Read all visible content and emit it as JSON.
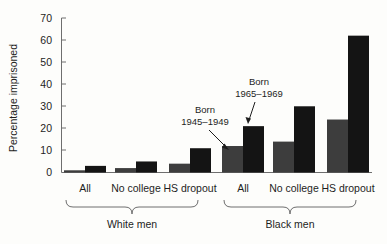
{
  "chart_data": {
    "type": "bar",
    "title": "",
    "subtitle": "",
    "xlabel": "",
    "ylabel": "Percentage imprisoned",
    "ylim": [
      0,
      70
    ],
    "yticks": [
      0,
      10,
      20,
      30,
      40,
      50,
      60,
      70
    ],
    "ytick_labels": [
      "0",
      "10",
      "20",
      "30",
      "40",
      "50",
      "60",
      "70"
    ],
    "grid": false,
    "legend_position": "none",
    "categories": [
      "All",
      "No college",
      "HS dropout",
      "All",
      "No college",
      "HS dropout"
    ],
    "group_labels": [
      "White men",
      "Black men"
    ],
    "series": [
      {
        "name": "Born 1945–1949",
        "color": "#3d3d3d",
        "values": [
          1,
          2,
          4,
          12,
          14,
          24
        ]
      },
      {
        "name": "Born 1965–1969",
        "color": "#141414",
        "values": [
          3,
          5,
          11,
          21,
          30,
          62
        ]
      }
    ],
    "annotations": [
      {
        "id": "annot-1945",
        "line1": "Born",
        "line2": "1945–1949",
        "target_series": "Born 1945–1949",
        "target_category": "All (Black men)"
      },
      {
        "id": "annot-1965",
        "line1": "Born",
        "line2": "1965–1969",
        "target_series": "Born 1965–1969",
        "target_category": "All (Black men)"
      }
    ]
  },
  "axis": {
    "y_title": "Percentage imprisoned",
    "ticks": [
      "70",
      "60",
      "50",
      "40",
      "30",
      "20",
      "10",
      "0"
    ]
  },
  "categories": {
    "white": [
      "All",
      "No college",
      "HS dropout"
    ],
    "black": [
      "All",
      "No college",
      "HS dropout"
    ]
  },
  "groups": {
    "white_label": "White men",
    "black_label": "Black men"
  },
  "annotations": {
    "a1_line1": "Born",
    "a1_line2": "1945–1949",
    "a2_line1": "Born",
    "a2_line2": "1965–1969"
  },
  "colors": {
    "series_old": "#3d3d3d",
    "series_new": "#141414",
    "axis": "#6e6e6e",
    "background": "#fdfdfb"
  }
}
